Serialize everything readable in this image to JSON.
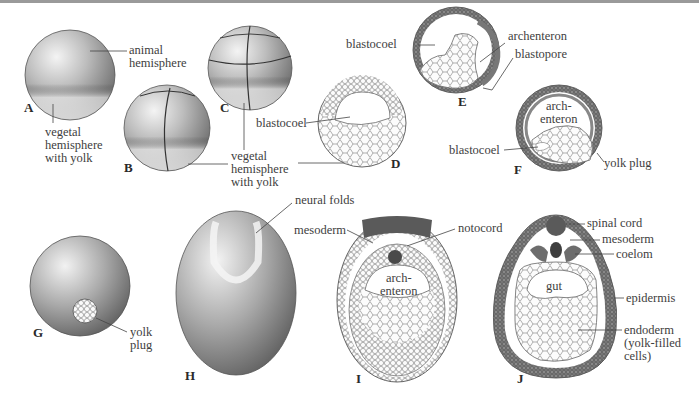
{
  "figure": {
    "panels": [
      {
        "id": "A",
        "letter": "A",
        "labels": [
          "animal\nhemisphere",
          "vegetal\nhemisphere\nwith yolk"
        ]
      },
      {
        "id": "B",
        "letter": "B",
        "labels": []
      },
      {
        "id": "C",
        "letter": "C",
        "labels": [
          "vegetal\nhemisphere\nwith yolk"
        ]
      },
      {
        "id": "D",
        "letter": "D",
        "labels": [
          "blastocoel"
        ]
      },
      {
        "id": "E",
        "letter": "E",
        "labels": [
          "blastocoel",
          "archenteron",
          "blastopore"
        ]
      },
      {
        "id": "F",
        "letter": "F",
        "labels": [
          "arch-\nenteron",
          "blastocoel",
          "yolk plug"
        ]
      },
      {
        "id": "G",
        "letter": "G",
        "labels": [
          "yolk\nplug"
        ]
      },
      {
        "id": "H",
        "letter": "H",
        "labels": [
          "neural folds"
        ]
      },
      {
        "id": "I",
        "letter": "I",
        "labels": [
          "mesoderm",
          "notocord",
          "arch-\nenteron"
        ]
      },
      {
        "id": "J",
        "letter": "J",
        "labels": [
          "spinal cord",
          "mesoderm",
          "coelom",
          "gut",
          "epidermis",
          "endoderm\n(yolk-filled\ncells)"
        ]
      }
    ]
  },
  "colors": {
    "ink": "#3a3a3a",
    "shade_dark": "#6e6e6e",
    "shade_mid": "#a8a8a8",
    "shade_light": "#dcdcdc",
    "background": "#ffffff"
  }
}
